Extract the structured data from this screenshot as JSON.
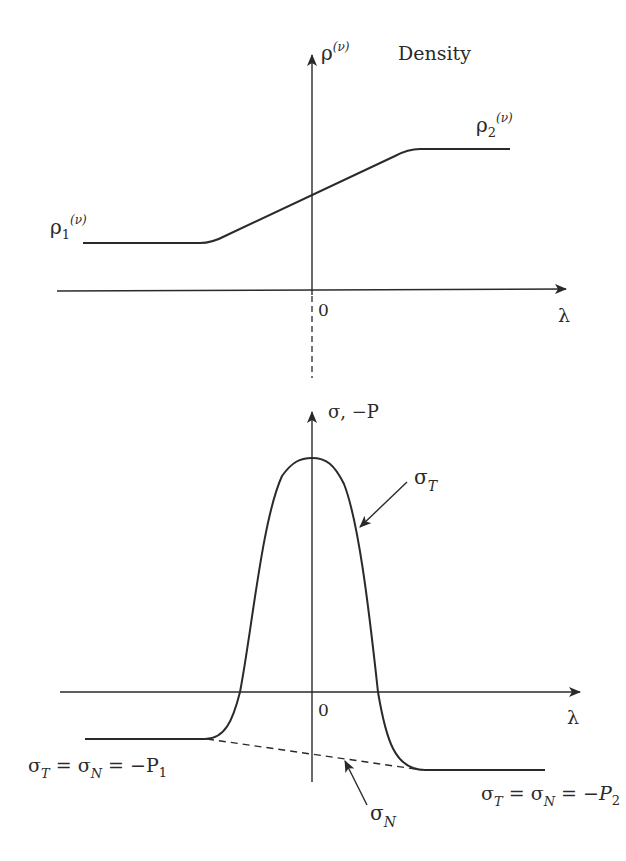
{
  "top_panel": {
    "title": "Density",
    "y_axis_label": "ρ",
    "y_axis_sup": "(ν)",
    "x_axis_label": "λ",
    "origin_label": "0",
    "left_level_label": "ρ",
    "left_level_sub": "1",
    "left_level_sup": "(ν)",
    "right_level_label": "ρ",
    "right_level_sub": "2",
    "right_level_sup": "(ν)"
  },
  "bottom_panel": {
    "y_axis_label": "σ, −P",
    "x_axis_label": "λ",
    "origin_label": "0",
    "curve_T_label": "σ",
    "curve_T_sub": "T",
    "curve_N_label": "σ",
    "curve_N_sub": "N",
    "left_eq": {
      "s1": "σ",
      "s1_sub": "T",
      "eq1": " = ",
      "s2": "σ",
      "s2_sub": "N",
      "eq2": " = −P",
      "p_sub": "1"
    },
    "right_eq": {
      "s1": "σ",
      "s1_sub": "T",
      "eq1": " = ",
      "s2": "σ",
      "s2_sub": "N",
      "eq2": " = −",
      "p": "P",
      "p_sub": "2"
    }
  },
  "colors": {
    "stroke": "#2a2a2a",
    "background": "#ffffff"
  }
}
